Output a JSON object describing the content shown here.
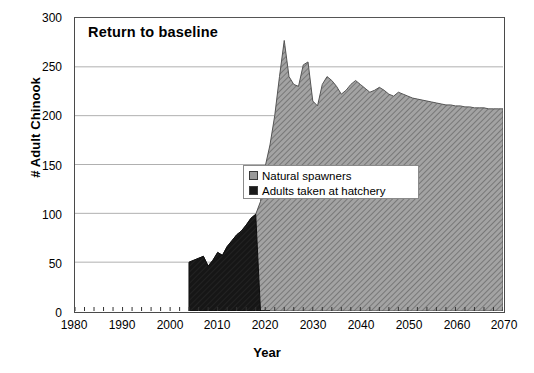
{
  "chart_data": {
    "type": "area",
    "title": "Return to baseline",
    "xlabel": "Year",
    "ylabel": "# Adult Chinook",
    "xlim": [
      1980,
      2070
    ],
    "ylim": [
      0,
      300
    ],
    "xticks": [
      1980,
      1990,
      2000,
      2010,
      2020,
      2030,
      2040,
      2050,
      2060,
      2070
    ],
    "yticks": [
      0,
      50,
      100,
      150,
      200,
      250,
      300
    ],
    "grid": "horizontal",
    "stacked": true,
    "legend_position": "center",
    "colors": {
      "natural_spawners": "#9a9a9a",
      "adults_hatchery": "#1a1a1a",
      "axis": "#4a4a4a",
      "gridline": "#b0b0b0"
    },
    "series": [
      {
        "name": "Natural spawners",
        "x": [
          2004,
          2005,
          2006,
          2007,
          2008,
          2009,
          2010,
          2011,
          2012,
          2013,
          2014,
          2015,
          2016,
          2017,
          2018,
          2019,
          2020,
          2021,
          2022,
          2023,
          2024,
          2025,
          2026,
          2027,
          2028,
          2029,
          2030,
          2031,
          2032,
          2033,
          2034,
          2035,
          2036,
          2037,
          2038,
          2039,
          2040,
          2041,
          2042,
          2043,
          2044,
          2045,
          2046,
          2047,
          2048,
          2049,
          2050,
          2051,
          2052,
          2053,
          2054,
          2055,
          2056,
          2057,
          2058,
          2059,
          2060,
          2061,
          2062,
          2063,
          2064,
          2065,
          2066,
          2067,
          2068,
          2069,
          2070
        ],
        "values": [
          50,
          52,
          54,
          56,
          46,
          52,
          60,
          57,
          66,
          72,
          78,
          82,
          88,
          95,
          99,
          112,
          148,
          170,
          200,
          240,
          277,
          240,
          232,
          230,
          252,
          255,
          215,
          210,
          232,
          240,
          236,
          230,
          222,
          226,
          232,
          236,
          232,
          228,
          224,
          226,
          229,
          226,
          222,
          220,
          224,
          222,
          220,
          218,
          217,
          216,
          215,
          214,
          213,
          212,
          211,
          211,
          210,
          210,
          209,
          209,
          208,
          208,
          208,
          207,
          207,
          207,
          207
        ]
      },
      {
        "name": "Adults taken at hatchery",
        "x": [
          2004,
          2005,
          2006,
          2007,
          2008,
          2009,
          2010,
          2011,
          2012,
          2013,
          2014,
          2015,
          2016,
          2017,
          2018,
          2019,
          2020,
          2021
        ],
        "values": [
          50,
          52,
          54,
          56,
          46,
          52,
          60,
          57,
          66,
          72,
          78,
          82,
          88,
          95,
          99,
          0,
          0,
          0
        ]
      }
    ],
    "annotations": [
      {
        "text": "Return to baseline",
        "type": "title-inset"
      }
    ]
  },
  "legend": {
    "items": [
      {
        "label": "Natural spawners",
        "swatch": "gray-hatch"
      },
      {
        "label": "Adults taken at hatchery",
        "swatch": "black-solid"
      }
    ]
  }
}
